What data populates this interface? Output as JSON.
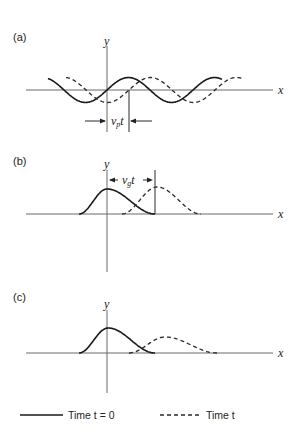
{
  "panels": [
    {
      "id": "a",
      "label": "(a)",
      "y_axis_label": "y",
      "x_axis_label": "x",
      "description": "Sinusoidal wave at time 0 (solid) and time t (dashed), shifted by phase velocity distance",
      "annotation": {
        "symbol": "v",
        "subscript": "p",
        "suffix": "t"
      }
    },
    {
      "id": "b",
      "label": "(b)",
      "y_axis_label": "y",
      "x_axis_label": "x",
      "description": "Pulse at time 0 (solid) and time t (dashed), translated by group velocity distance without change of shape",
      "annotation": {
        "symbol": "v",
        "subscript": "g",
        "suffix": "t"
      }
    },
    {
      "id": "c",
      "label": "(c)",
      "y_axis_label": "y",
      "x_axis_label": "x",
      "description": "Pulse at time 0 (solid) and dispersed, broadened pulse at time t (dashed)"
    }
  ],
  "legend": {
    "solid_label": "Time t = 0",
    "dashed_label": "Time t"
  },
  "colors": {
    "curve": "#1a1a1a",
    "axis": "#6b6b6b",
    "background": "#ffffff"
  }
}
